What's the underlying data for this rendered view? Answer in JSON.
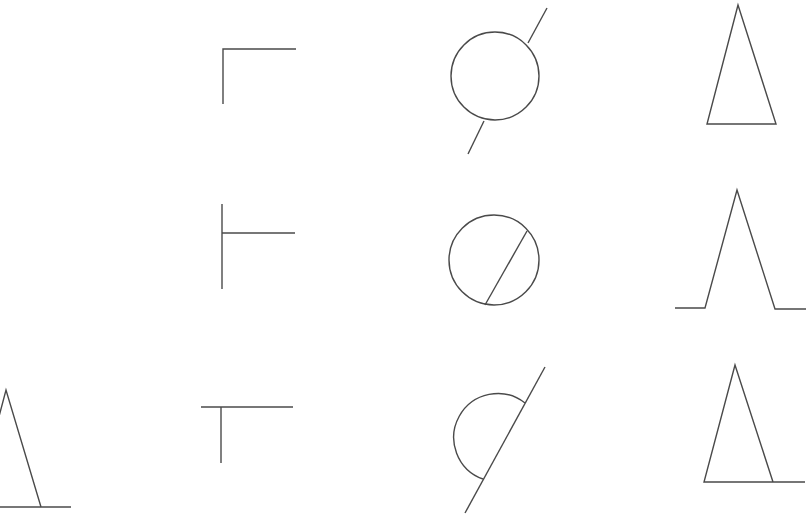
{
  "figure": {
    "background": "#ffffff",
    "stroke_color": "#4a4a4a",
    "rows": [
      {
        "row": 1,
        "cells": [
          {
            "col": 1,
            "shape": "empty"
          },
          {
            "col": 2,
            "shape": "corner-top-left"
          },
          {
            "col": 3,
            "shape": "circle-with-line-through-outside"
          },
          {
            "col": 4,
            "shape": "triangle"
          }
        ]
      },
      {
        "row": 2,
        "cells": [
          {
            "col": 1,
            "shape": "empty"
          },
          {
            "col": 2,
            "shape": "vertical-line-with-side-branch"
          },
          {
            "col": 3,
            "shape": "circle-with-chord"
          },
          {
            "col": 4,
            "shape": "peak-with-baseline-tails"
          }
        ]
      },
      {
        "row": 3,
        "cells": [
          {
            "col": 1,
            "shape": "partial-triangle-on-baseline"
          },
          {
            "col": 2,
            "shape": "t-shape"
          },
          {
            "col": 3,
            "shape": "half-circle-on-diagonal-line"
          },
          {
            "col": 4,
            "shape": "triangle-with-extended-base"
          }
        ]
      }
    ]
  }
}
